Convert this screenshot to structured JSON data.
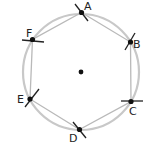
{
  "diagram": {
    "center": {
      "x": 81,
      "y": 72
    },
    "circle": {
      "r": 58,
      "color": "#c8c8c8"
    },
    "points": [
      {
        "label": "A",
        "x": 81.5,
        "y": 12.5,
        "lx": 84,
        "ly": 10
      },
      {
        "label": "B",
        "x": 130.5,
        "y": 42,
        "lx": 133,
        "ly": 48
      },
      {
        "label": "C",
        "x": 131,
        "y": 101.5,
        "lx": 129,
        "ly": 115
      },
      {
        "label": "D",
        "x": 79.5,
        "y": 129.5,
        "lx": 69,
        "ly": 142
      },
      {
        "label": "E",
        "x": 30,
        "y": 99,
        "lx": 17,
        "ly": 103
      },
      {
        "label": "F",
        "x": 32.5,
        "y": 39.5,
        "lx": 26,
        "ly": 37
      }
    ]
  }
}
